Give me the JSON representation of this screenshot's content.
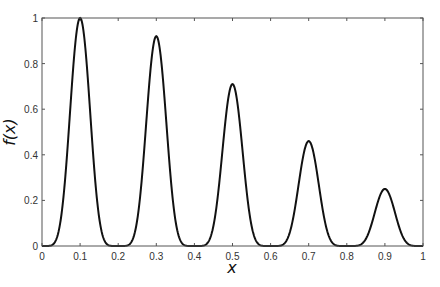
{
  "chart_data": {
    "type": "line",
    "title": "",
    "xlabel": "x",
    "ylabel": "f(x)",
    "xlim": [
      0,
      1
    ],
    "ylim": [
      0,
      1
    ],
    "grid": false,
    "legend": null,
    "x_ticks": [
      "0",
      "0.1",
      "0.2",
      "0.3",
      "0.4",
      "0.5",
      "0.6",
      "0.7",
      "0.8",
      "0.9",
      "1"
    ],
    "y_ticks": [
      "0",
      "0.2",
      "0.4",
      "0.6",
      "0.8",
      "1"
    ],
    "series": [
      {
        "name": "f(x)",
        "color": "#111111",
        "peaks": [
          {
            "x": 0.1,
            "y": 1.0
          },
          {
            "x": 0.3,
            "y": 0.92
          },
          {
            "x": 0.5,
            "y": 0.71
          },
          {
            "x": 0.7,
            "y": 0.46
          },
          {
            "x": 0.9,
            "y": 0.25
          }
        ],
        "zeros": [
          0.0,
          0.2,
          0.4,
          0.6,
          0.8,
          1.0
        ]
      }
    ]
  }
}
